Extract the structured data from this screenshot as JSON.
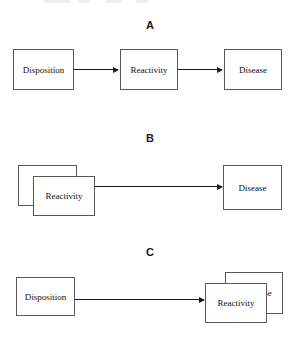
{
  "figure": {
    "caption_artifact": "",
    "panels": [
      {
        "id": "A",
        "label": "A",
        "description": "Full mediation chain: Disposition leads to Reactivity leads to Disease",
        "nodes": [
          {
            "id": "a-disposition",
            "label": "Disposition",
            "role": "antecedent"
          },
          {
            "id": "a-reactivity",
            "label": "Reactivity",
            "role": "mediator"
          },
          {
            "id": "a-disease",
            "label": "Disease",
            "role": "outcome"
          }
        ],
        "arrows": [
          {
            "id": "a-arrow-1",
            "from": "Disposition",
            "to": "Reactivity"
          },
          {
            "id": "a-arrow-2",
            "from": "Reactivity",
            "to": "Disease"
          }
        ]
      },
      {
        "id": "B",
        "label": "B",
        "description": "Disposition and Reactivity overlap as one construct, which leads to Disease",
        "nodes": [
          {
            "id": "b-disposition",
            "label": "Disposition",
            "visible_label": "Dis",
            "role": "antecedent",
            "stacking": "back"
          },
          {
            "id": "b-reactivity",
            "label": "Reactivity",
            "visible_label": "Reactivity",
            "role": "mediator",
            "stacking": "front"
          },
          {
            "id": "b-disease",
            "label": "Disease",
            "visible_label": "Disease",
            "role": "outcome",
            "stacking": "single"
          }
        ],
        "arrows": [
          {
            "id": "b-arrow-1",
            "from": "Reactivity",
            "to": "Disease"
          }
        ]
      },
      {
        "id": "C",
        "label": "C",
        "description": "Disposition leads to an overlapping Reactivity and Disease construct",
        "nodes": [
          {
            "id": "c-disposition",
            "label": "Disposition",
            "visible_label": "Disposition",
            "role": "antecedent",
            "stacking": "single"
          },
          {
            "id": "c-disease",
            "label": "Disease",
            "visible_label": "ease",
            "role": "outcome",
            "stacking": "back"
          },
          {
            "id": "c-reactivity",
            "label": "Reactivity",
            "visible_label": "Reactivity",
            "role": "mediator",
            "stacking": "front"
          }
        ],
        "arrows": [
          {
            "id": "c-arrow-1",
            "from": "Disposition",
            "to": "Reactivity"
          }
        ]
      }
    ]
  }
}
